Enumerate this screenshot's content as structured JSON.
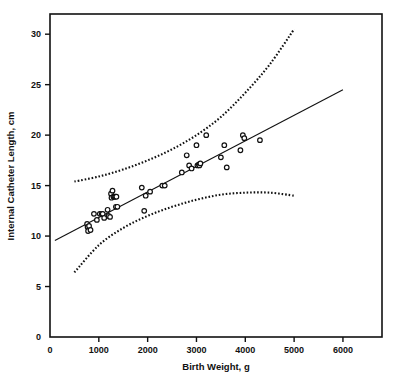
{
  "chart_data": {
    "type": "scatter",
    "title": "",
    "xlabel": "Birth Weight, g",
    "ylabel": "Internal Catheter Length, cm",
    "xlim": [
      0,
      6800
    ],
    "ylim": [
      0,
      32
    ],
    "xticks": [
      0,
      1000,
      2000,
      3000,
      4000,
      5000,
      6000
    ],
    "xticklabels": [
      "0",
      "1000",
      "2000",
      "3000",
      "4000",
      "5000",
      "6000"
    ],
    "yticks": [
      0,
      5,
      10,
      15,
      20,
      25,
      30
    ],
    "yticklabels": [
      "0",
      "5",
      "10",
      "15",
      "20",
      "25",
      "30"
    ],
    "grid": false,
    "legend": "none",
    "marker": "open-circle",
    "points": [
      {
        "x": 760,
        "y": 11.2
      },
      {
        "x": 770,
        "y": 10.9
      },
      {
        "x": 780,
        "y": 10.5
      },
      {
        "x": 800,
        "y": 11.0
      },
      {
        "x": 830,
        "y": 10.6
      },
      {
        "x": 900,
        "y": 12.2
      },
      {
        "x": 960,
        "y": 11.6
      },
      {
        "x": 1020,
        "y": 12.2
      },
      {
        "x": 1060,
        "y": 12.2
      },
      {
        "x": 1080,
        "y": 12.2
      },
      {
        "x": 1110,
        "y": 11.8
      },
      {
        "x": 1180,
        "y": 12.6
      },
      {
        "x": 1200,
        "y": 12.0
      },
      {
        "x": 1230,
        "y": 11.9
      },
      {
        "x": 1250,
        "y": 14.2
      },
      {
        "x": 1260,
        "y": 13.8
      },
      {
        "x": 1280,
        "y": 14.5
      },
      {
        "x": 1300,
        "y": 13.9
      },
      {
        "x": 1320,
        "y": 13.9
      },
      {
        "x": 1340,
        "y": 13.9
      },
      {
        "x": 1360,
        "y": 13.9
      },
      {
        "x": 1350,
        "y": 12.9
      },
      {
        "x": 1380,
        "y": 12.9
      },
      {
        "x": 1880,
        "y": 14.8
      },
      {
        "x": 1930,
        "y": 12.5
      },
      {
        "x": 1960,
        "y": 14.0
      },
      {
        "x": 2050,
        "y": 14.4
      },
      {
        "x": 2300,
        "y": 15.0
      },
      {
        "x": 2350,
        "y": 15.0
      },
      {
        "x": 2700,
        "y": 16.3
      },
      {
        "x": 2800,
        "y": 18.0
      },
      {
        "x": 2850,
        "y": 17.0
      },
      {
        "x": 2900,
        "y": 16.7
      },
      {
        "x": 3000,
        "y": 19.0
      },
      {
        "x": 3020,
        "y": 17.0
      },
      {
        "x": 3050,
        "y": 17.1
      },
      {
        "x": 3060,
        "y": 17.0
      },
      {
        "x": 3080,
        "y": 17.2
      },
      {
        "x": 3200,
        "y": 20.0
      },
      {
        "x": 3500,
        "y": 17.8
      },
      {
        "x": 3570,
        "y": 19.0
      },
      {
        "x": 3620,
        "y": 16.8
      },
      {
        "x": 3900,
        "y": 18.5
      },
      {
        "x": 3950,
        "y": 20.0
      },
      {
        "x": 3980,
        "y": 19.7
      },
      {
        "x": 4300,
        "y": 19.5
      }
    ],
    "fit_line": {
      "label": "regression line",
      "style": "solid",
      "x": [
        100,
        6000
      ],
      "y": [
        9.55,
        24.5
      ]
    },
    "prediction_band_upper": {
      "label": "upper prediction limit",
      "style": "dotted",
      "x": [
        500,
        1000,
        1500,
        2000,
        2500,
        3000,
        3500,
        4000,
        4500,
        5000
      ],
      "y": [
        15.4,
        15.9,
        16.6,
        17.5,
        18.6,
        20.0,
        21.8,
        24.2,
        27.0,
        30.5
      ]
    },
    "prediction_band_lower": {
      "label": "lower prediction limit",
      "style": "dotted",
      "x": [
        500,
        1000,
        1500,
        2000,
        2500,
        3000,
        3500,
        4000,
        4500,
        5000
      ],
      "y": [
        6.4,
        9.1,
        10.8,
        12.0,
        12.9,
        13.6,
        14.1,
        14.3,
        14.3,
        14.0
      ]
    }
  }
}
